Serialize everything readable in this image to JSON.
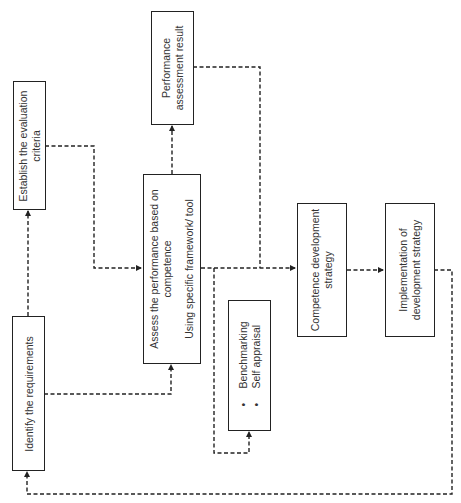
{
  "diagram": {
    "type": "flowchart",
    "orientation": "rotated-90-ccw",
    "line_style": "dashed",
    "colors": {
      "border": "#222222",
      "text": "#333333",
      "connector": "#222222",
      "background": "#ffffff"
    },
    "nodes": {
      "identify": {
        "lines": [
          "Identify the requirements"
        ]
      },
      "establish": {
        "lines": [
          "Establish the evaluation",
          "criteria"
        ]
      },
      "assess": {
        "lines": [
          "Assess the performance based on",
          "competence"
        ],
        "sub": "Using specific framework/ tool"
      },
      "result": {
        "lines": [
          "Performance",
          "assessment result"
        ]
      },
      "methods": {
        "bullets": [
          "Benchmarking",
          "Self appraisal"
        ]
      },
      "competence": {
        "lines": [
          "Competence development",
          "strategy"
        ]
      },
      "implementation": {
        "lines": [
          "Implementation of",
          "development strategy"
        ]
      }
    },
    "edges": [
      {
        "from": "Identify the requirements",
        "to": "Establish the evaluation criteria"
      },
      {
        "from": "Establish the evaluation criteria",
        "to": "Assess the performance based on competence"
      },
      {
        "from": "Identify the requirements",
        "to": "Assess the performance based on competence"
      },
      {
        "from": "Assess the performance based on competence",
        "to": "Performance assessment result"
      },
      {
        "from": "Assess the performance based on competence",
        "to": "Benchmarking / Self appraisal"
      },
      {
        "from": "Assess the performance based on competence",
        "to": "Competence development strategy"
      },
      {
        "from": "Performance assessment result",
        "to": "Competence development strategy"
      },
      {
        "from": "Competence development strategy",
        "to": "Implementation of development strategy"
      },
      {
        "from": "Implementation of development strategy",
        "to": "Identify the requirements"
      }
    ]
  }
}
